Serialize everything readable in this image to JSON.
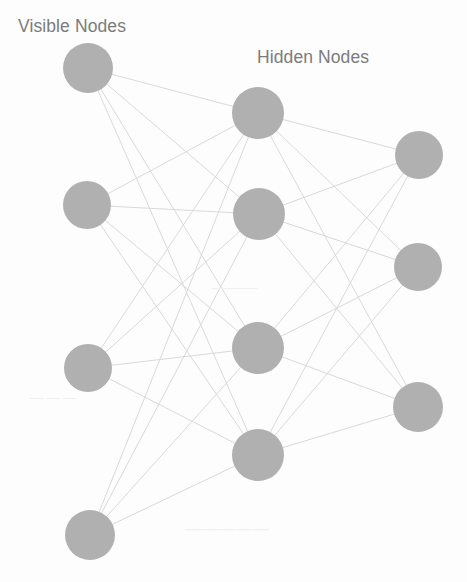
{
  "canvas": {
    "width": 467,
    "height": 582,
    "background_color": "#fdfdfd"
  },
  "style": {
    "node_fill_color": "#b0b0b0",
    "edge_color": "#d9d9d9",
    "label_text_color": "#7b7b7b"
  },
  "labels": {
    "visible": "Visible Nodes",
    "hidden": "Hidden Nodes"
  },
  "artifacts": {
    "bleed_a": "———",
    "bleed_b": "— — —",
    "bleed_c": "—————"
  },
  "chart_data": {
    "type": "diagram",
    "layers": [
      {
        "name": "Visible Nodes",
        "label": "Visible Nodes",
        "count": 4,
        "nodes": [
          {
            "id": "v1",
            "cx": 88,
            "cy": 68,
            "r": 25
          },
          {
            "id": "v2",
            "cx": 87,
            "cy": 205,
            "r": 24
          },
          {
            "id": "v3",
            "cx": 88,
            "cy": 368,
            "r": 24
          },
          {
            "id": "v4",
            "cx": 90,
            "cy": 535,
            "r": 25
          }
        ]
      },
      {
        "name": "Hidden Nodes",
        "label": "Hidden Nodes",
        "count": 4,
        "nodes": [
          {
            "id": "h1",
            "cx": 258,
            "cy": 113,
            "r": 26
          },
          {
            "id": "h2",
            "cx": 259,
            "cy": 214,
            "r": 26
          },
          {
            "id": "h3",
            "cx": 258,
            "cy": 348,
            "r": 26
          },
          {
            "id": "h4",
            "cx": 258,
            "cy": 455,
            "r": 26
          }
        ]
      },
      {
        "name": "Output Nodes",
        "label": "",
        "count": 3,
        "nodes": [
          {
            "id": "o1",
            "cx": 419,
            "cy": 155,
            "r": 24
          },
          {
            "id": "o2",
            "cx": 418,
            "cy": 267,
            "r": 24
          },
          {
            "id": "o3",
            "cx": 418,
            "cy": 407,
            "r": 25
          }
        ]
      }
    ],
    "connectivity": "fully-connected between adjacent layers",
    "edge_count": 28
  }
}
